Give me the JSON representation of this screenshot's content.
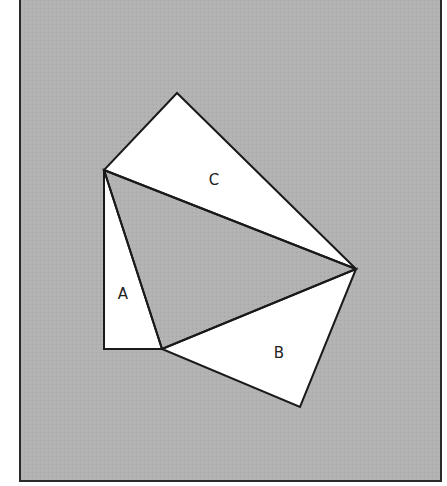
{
  "diagram": {
    "type": "geometric proof figure (Pythagorean theorem)",
    "colors": {
      "page": "#ffffff",
      "frame_fill": "#b2b2b2",
      "frame_stroke": "#2a2a2a",
      "shape_fill": "#ffffff",
      "shape_stroke": "#1a1a1a"
    },
    "frame": {
      "x": 20,
      "y": -2,
      "width": 421,
      "height": 483
    },
    "triangles": [
      {
        "id": "A",
        "label": "A",
        "points": [
          [
            104,
            170
          ],
          [
            104,
            349
          ],
          [
            162,
            349
          ]
        ],
        "label_pos": [
          123,
          299
        ]
      },
      {
        "id": "B",
        "label": "B",
        "points": [
          [
            162,
            349
          ],
          [
            356,
            269
          ],
          [
            300,
            407
          ]
        ],
        "label_pos": [
          279,
          358
        ]
      },
      {
        "id": "C",
        "label": "C",
        "points": [
          [
            177,
            93
          ],
          [
            104,
            170
          ],
          [
            356,
            269
          ]
        ],
        "label_pos": [
          214,
          185
        ]
      }
    ],
    "central_triangle": {
      "points": [
        [
          104,
          170
        ],
        [
          162,
          349
        ],
        [
          356,
          269
        ]
      ]
    }
  }
}
